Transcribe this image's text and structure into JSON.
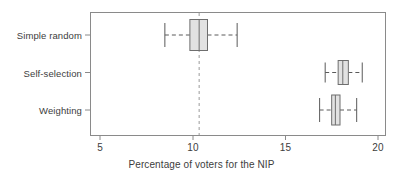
{
  "chart_data": {
    "type": "box",
    "title": "",
    "xlabel": "Percentage of voters for the NIP",
    "ylabel": "",
    "xlim": [
      4.5,
      20.35
    ],
    "xticks": [
      5,
      10,
      15,
      20
    ],
    "xticklabels": [
      "5",
      "10",
      "15",
      "20"
    ],
    "categories": [
      "Simple random",
      "Self-selection",
      "Weighting"
    ],
    "grid": false,
    "legend": false,
    "orientation": "horizontal",
    "reference_line": {
      "value": 10.35,
      "style": "dashed",
      "color": "#9a9a9a",
      "orientation": "vertical"
    },
    "boxes": [
      {
        "category": "Simple random",
        "whisker_low": 8.5,
        "q1": 9.85,
        "median": 10.35,
        "q3": 10.8,
        "whisker_high": 12.4,
        "box_fill": "#e2e2e2",
        "box_edge": "#6e6e6e"
      },
      {
        "category": "Self-selection",
        "whisker_low": 17.15,
        "q1": 17.85,
        "median": 18.1,
        "q3": 18.4,
        "whisker_high": 19.15,
        "box_fill": "#e2e2e2",
        "box_edge": "#6e6e6e"
      },
      {
        "category": "Weighting",
        "whisker_low": 16.85,
        "q1": 17.5,
        "median": 17.7,
        "q3": 17.95,
        "whisker_high": 18.85,
        "box_fill": "#e2e2e2",
        "box_edge": "#6e6e6e"
      }
    ],
    "colors": {
      "frame": "#8a8a8a",
      "box_fill": "#e2e2e2",
      "box_edge": "#6e6e6e",
      "whisker": "#5a5a5a",
      "reference_line": "#9a9a9a",
      "text": "#3d3d3d",
      "background": "#ffffff"
    }
  }
}
